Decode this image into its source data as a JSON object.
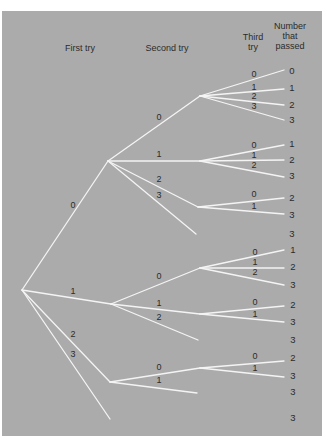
{
  "colors": {
    "background": "#ffffff",
    "panel": "#ababab",
    "branch": "#f4f4f4",
    "text": "#2b2b2b"
  },
  "headers": {
    "first_try": "First try",
    "second_try": "Second try",
    "third_try": "Third try",
    "number_passed": "Number that passed"
  },
  "tree": {
    "root": {
      "x": 22,
      "y": 290
    },
    "first_try": [
      {
        "label": "0",
        "node": {
          "x": 108,
          "y": 161
        },
        "label_pos": {
          "x": 73,
          "y": 205
        },
        "second_try": [
          {
            "label": "0",
            "node": {
              "x": 200,
              "y": 96
            },
            "label_pos": {
              "x": 159,
              "y": 117
            },
            "third_try": [
              {
                "label": "0",
                "label_pos": {
                  "x": 254,
                  "y": 74
                },
                "end": {
                  "x": 284,
                  "y": 70
                },
                "passed": "0",
                "passed_pos": {
                  "x": 292,
                  "y": 71
                }
              },
              {
                "label": "1",
                "label_pos": {
                  "x": 254,
                  "y": 87
                },
                "end": {
                  "x": 284,
                  "y": 89
                },
                "passed": "1",
                "passed_pos": {
                  "x": 292,
                  "y": 88
                }
              },
              {
                "label": "2",
                "label_pos": {
                  "x": 254,
                  "y": 96
                },
                "end": {
                  "x": 284,
                  "y": 105
                },
                "passed": "2",
                "passed_pos": {
                  "x": 292,
                  "y": 105
                }
              },
              {
                "label": "3",
                "label_pos": {
                  "x": 254,
                  "y": 106
                },
                "end": {
                  "x": 284,
                  "y": 120
                },
                "passed": "3",
                "passed_pos": {
                  "x": 292,
                  "y": 120
                }
              }
            ]
          },
          {
            "label": "1",
            "node": {
              "x": 200,
              "y": 161
            },
            "label_pos": {
              "x": 159,
              "y": 154
            },
            "third_try": [
              {
                "label": "0",
                "label_pos": {
                  "x": 254,
                  "y": 145
                },
                "end": {
                  "x": 284,
                  "y": 145
                },
                "passed": "1",
                "passed_pos": {
                  "x": 292,
                  "y": 144
                }
              },
              {
                "label": "1",
                "label_pos": {
                  "x": 254,
                  "y": 155
                },
                "end": {
                  "x": 284,
                  "y": 160
                },
                "passed": "2",
                "passed_pos": {
                  "x": 292,
                  "y": 160
                }
              },
              {
                "label": "2",
                "label_pos": {
                  "x": 254,
                  "y": 165
                },
                "end": {
                  "x": 284,
                  "y": 177
                },
                "passed": "3",
                "passed_pos": {
                  "x": 292,
                  "y": 176
                }
              }
            ]
          },
          {
            "label": "2",
            "node": {
              "x": 198,
              "y": 207
            },
            "label_pos": {
              "x": 159,
              "y": 179
            },
            "third_try": [
              {
                "label": "0",
                "label_pos": {
                  "x": 254,
                  "y": 194
                },
                "end": {
                  "x": 284,
                  "y": 198
                },
                "passed": "2",
                "passed_pos": {
                  "x": 292,
                  "y": 198
                }
              },
              {
                "label": "1",
                "label_pos": {
                  "x": 254,
                  "y": 206
                },
                "end": {
                  "x": 284,
                  "y": 214
                },
                "passed": "3",
                "passed_pos": {
                  "x": 292,
                  "y": 215
                }
              }
            ]
          },
          {
            "label": "3",
            "leaf": {
              "x": 196,
              "y": 234
            },
            "label_pos": {
              "x": 159,
              "y": 195
            },
            "passed": "3",
            "passed_pos": {
              "x": 292,
              "y": 234
            }
          }
        ]
      },
      {
        "label": "1",
        "node": {
          "x": 111,
          "y": 304
        },
        "label_pos": {
          "x": 73,
          "y": 291
        },
        "second_try": [
          {
            "label": "0",
            "node": {
              "x": 200,
              "y": 268
            },
            "label_pos": {
              "x": 159,
              "y": 276
            },
            "third_try": [
              {
                "label": "0",
                "label_pos": {
                  "x": 255,
                  "y": 252
                },
                "end": {
                  "x": 284,
                  "y": 250
                },
                "passed": "1",
                "passed_pos": {
                  "x": 293,
                  "y": 250
                }
              },
              {
                "label": "1",
                "label_pos": {
                  "x": 255,
                  "y": 262
                },
                "end": {
                  "x": 284,
                  "y": 268
                },
                "passed": "2",
                "passed_pos": {
                  "x": 293,
                  "y": 267
                }
              },
              {
                "label": "2",
                "label_pos": {
                  "x": 255,
                  "y": 272
                },
                "end": {
                  "x": 284,
                  "y": 285
                },
                "passed": "3",
                "passed_pos": {
                  "x": 293,
                  "y": 285
                }
              }
            ]
          },
          {
            "label": "1",
            "node": {
              "x": 200,
              "y": 314
            },
            "label_pos": {
              "x": 159,
              "y": 303
            },
            "third_try": [
              {
                "label": "0",
                "label_pos": {
                  "x": 255,
                  "y": 302
                },
                "end": {
                  "x": 284,
                  "y": 306
                },
                "passed": "2",
                "passed_pos": {
                  "x": 293,
                  "y": 305
                }
              },
              {
                "label": "1",
                "label_pos": {
                  "x": 255,
                  "y": 314
                },
                "end": {
                  "x": 284,
                  "y": 322
                },
                "passed": "3",
                "passed_pos": {
                  "x": 293,
                  "y": 322
                }
              }
            ]
          },
          {
            "label": "2",
            "leaf": {
              "x": 198,
              "y": 340
            },
            "label_pos": {
              "x": 159,
              "y": 317
            },
            "passed": "3",
            "passed_pos": {
              "x": 293,
              "y": 340
            }
          }
        ]
      },
      {
        "label": "2",
        "node": {
          "x": 110,
          "y": 382
        },
        "label_pos": {
          "x": 73,
          "y": 334
        },
        "second_try": [
          {
            "label": "0",
            "node": {
              "x": 200,
              "y": 368
            },
            "label_pos": {
              "x": 159,
              "y": 367
            },
            "third_try": [
              {
                "label": "0",
                "label_pos": {
                  "x": 255,
                  "y": 356
                },
                "end": {
                  "x": 284,
                  "y": 361
                },
                "passed": "2",
                "passed_pos": {
                  "x": 293,
                  "y": 358
                }
              },
              {
                "label": "1",
                "label_pos": {
                  "x": 255,
                  "y": 368
                },
                "end": {
                  "x": 284,
                  "y": 377
                },
                "passed": "3",
                "passed_pos": {
                  "x": 293,
                  "y": 376
                }
              }
            ]
          },
          {
            "label": "1",
            "leaf": {
              "x": 197,
              "y": 393
            },
            "label_pos": {
              "x": 159,
              "y": 380
            },
            "passed": "3",
            "passed_pos": {
              "x": 293,
              "y": 392
            }
          }
        ]
      },
      {
        "label": "3",
        "leaf": {
          "x": 110,
          "y": 419
        },
        "label_pos": {
          "x": 73,
          "y": 354
        },
        "passed": "3",
        "passed_pos": {
          "x": 293,
          "y": 418
        }
      }
    ]
  }
}
